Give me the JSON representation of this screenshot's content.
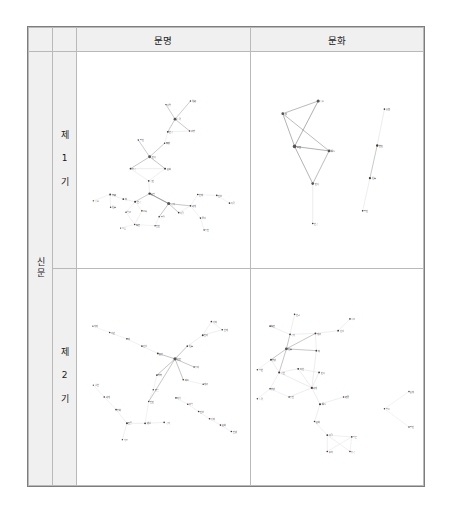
{
  "figure": {
    "caption": "",
    "colors": {
      "node": "#3a3a3a",
      "hub": "#555555",
      "edge": "#6e6e6e",
      "edge_light": "#c8c8c8",
      "header_bg": "#f0f0f0",
      "border": "#b9b9b9",
      "outer_border": "#7d7d7d",
      "label": "#1a1a1a"
    },
    "columns": [
      {
        "id": "munmyeong",
        "label": "문명"
      },
      {
        "id": "munhwa",
        "label": "문화"
      }
    ],
    "row_group_label": "신문",
    "rows": [
      {
        "id": "period1",
        "label": "제\n1\n기"
      },
      {
        "id": "period2",
        "label": "제\n2\n기"
      }
    ]
  },
  "chart_data": [
    {
      "id": "p1-munmyeong",
      "type": "network",
      "title": "제1기 · 문명",
      "nodes": [
        {
          "id": "n1",
          "label": "사업",
          "x": 196,
          "y": 58,
          "r": 1.6
        },
        {
          "id": "n2",
          "label": "洗練",
          "x": 250,
          "y": 50,
          "r": 1.6
        },
        {
          "id": "n3",
          "label": "노력",
          "x": 216,
          "y": 90,
          "r": 3.2
        },
        {
          "id": "n4",
          "label": "경향",
          "x": 248,
          "y": 116,
          "r": 1.8
        },
        {
          "id": "n5",
          "label": "한국",
          "x": 200,
          "y": 118,
          "r": 2.0
        },
        {
          "id": "n6",
          "label": "朝鮮",
          "x": 193,
          "y": 143,
          "r": 1.6
        },
        {
          "id": "n7",
          "label": "발전",
          "x": 135,
          "y": 136,
          "r": 1.6
        },
        {
          "id": "n8",
          "label": "민족",
          "x": 160,
          "y": 173,
          "r": 3.2
        },
        {
          "id": "n9",
          "label": "조국",
          "x": 118,
          "y": 199,
          "r": 2.0
        },
        {
          "id": "n10",
          "label": "문화",
          "x": 194,
          "y": 199,
          "r": 2.2
        },
        {
          "id": "n11",
          "label": "국민",
          "x": 158,
          "y": 226,
          "r": 1.8
        },
        {
          "id": "n12",
          "label": "문명",
          "x": 160,
          "y": 254,
          "r": 2.6
        },
        {
          "id": "n13",
          "label": "국가",
          "x": 202,
          "y": 276,
          "r": 3.4
        },
        {
          "id": "n14",
          "label": "한국",
          "x": 128,
          "y": 272,
          "r": 2.2
        },
        {
          "id": "n15",
          "label": "新",
          "x": 102,
          "y": 266,
          "r": 2.0
        },
        {
          "id": "n16",
          "label": "交驩",
          "x": 73,
          "y": 256,
          "r": 2.0
        },
        {
          "id": "n17",
          "label": "흡수",
          "x": 36,
          "y": 270,
          "r": 1.6
        },
        {
          "id": "n18",
          "label": "社會",
          "x": 74,
          "y": 284,
          "r": 1.6
        },
        {
          "id": "n19",
          "label": "학교",
          "x": 108,
          "y": 295,
          "r": 1.6
        },
        {
          "id": "n20",
          "label": "교육",
          "x": 143,
          "y": 292,
          "r": 1.8
        },
        {
          "id": "n21",
          "label": "人士",
          "x": 96,
          "y": 330,
          "r": 1.4
        },
        {
          "id": "n22",
          "label": "程度",
          "x": 127,
          "y": 322,
          "r": 1.6
        },
        {
          "id": "n23",
          "label": "인민",
          "x": 172,
          "y": 325,
          "r": 1.6
        },
        {
          "id": "n24",
          "label": "발달",
          "x": 181,
          "y": 305,
          "r": 1.8
        },
        {
          "id": "n25",
          "label": "사람",
          "x": 224,
          "y": 296,
          "r": 1.8
        },
        {
          "id": "n26",
          "label": "세계",
          "x": 250,
          "y": 281,
          "r": 1.8
        },
        {
          "id": "n27",
          "label": "현재",
          "x": 266,
          "y": 256,
          "r": 1.8
        },
        {
          "id": "n28",
          "label": "진보",
          "x": 308,
          "y": 258,
          "r": 1.8
        },
        {
          "id": "n29",
          "label": "독립",
          "x": 336,
          "y": 275,
          "r": 1.8
        },
        {
          "id": "n30",
          "label": "물질",
          "x": 272,
          "y": 308,
          "r": 1.8
        },
        {
          "id": "n31",
          "label": "증진",
          "x": 280,
          "y": 334,
          "r": 1.6
        }
      ],
      "edges": [
        [
          "n1",
          "n3"
        ],
        [
          "n2",
          "n3"
        ],
        [
          "n3",
          "n4"
        ],
        [
          "n3",
          "n5"
        ],
        [
          "n5",
          "n4"
        ],
        [
          "n5",
          "n6"
        ],
        [
          "n6",
          "n8"
        ],
        [
          "n7",
          "n8"
        ],
        [
          "n8",
          "n9"
        ],
        [
          "n8",
          "n10"
        ],
        [
          "n9",
          "n10"
        ],
        [
          "n9",
          "n11"
        ],
        [
          "n10",
          "n11"
        ],
        [
          "n11",
          "n12"
        ],
        [
          "n12",
          "n13"
        ],
        [
          "n12",
          "n14"
        ],
        [
          "n14",
          "n15"
        ],
        [
          "n15",
          "n16"
        ],
        [
          "n16",
          "n17"
        ],
        [
          "n16",
          "n18"
        ],
        [
          "n14",
          "n19"
        ],
        [
          "n14",
          "n20"
        ],
        [
          "n19",
          "n22"
        ],
        [
          "n20",
          "n22"
        ],
        [
          "n21",
          "n22"
        ],
        [
          "n22",
          "n23"
        ],
        [
          "n13",
          "n24"
        ],
        [
          "n24",
          "n23"
        ],
        [
          "n13",
          "n25"
        ],
        [
          "n13",
          "n26"
        ],
        [
          "n26",
          "n25"
        ],
        [
          "n26",
          "n27"
        ],
        [
          "n27",
          "n28"
        ],
        [
          "n28",
          "n29"
        ],
        [
          "n26",
          "n30"
        ],
        [
          "n30",
          "n31"
        ],
        [
          "n13",
          "n12"
        ]
      ]
    },
    {
      "id": "p1-munhwa",
      "type": "network",
      "title": "제1기 · 문화",
      "nodes": [
        {
          "id": "m1",
          "label": "흡수",
          "x": 148,
          "y": 50,
          "r": 3.4
        },
        {
          "id": "m2",
          "label": "新",
          "x": 70,
          "y": 78,
          "r": 3.0
        },
        {
          "id": "m3",
          "label": "泰西",
          "x": 96,
          "y": 150,
          "r": 4.0
        },
        {
          "id": "m4",
          "label": "輸入",
          "x": 172,
          "y": 160,
          "r": 3.2
        },
        {
          "id": "m5",
          "label": "민족",
          "x": 136,
          "y": 232,
          "r": 3.0
        },
        {
          "id": "m6",
          "label": "한국",
          "x": 136,
          "y": 320,
          "r": 1.8
        },
        {
          "id": "m7",
          "label": "東西",
          "x": 294,
          "y": 68,
          "r": 1.8
        },
        {
          "id": "m8",
          "label": "변천",
          "x": 278,
          "y": 148,
          "r": 2.6
        },
        {
          "id": "m9",
          "label": "社會",
          "x": 262,
          "y": 220,
          "r": 2.4
        },
        {
          "id": "m10",
          "label": "발전",
          "x": 246,
          "y": 292,
          "r": 1.8
        }
      ],
      "edges": [
        [
          "m1",
          "m2"
        ],
        [
          "m1",
          "m3"
        ],
        [
          "m2",
          "m4"
        ],
        [
          "m3",
          "m4"
        ],
        [
          "m2",
          "m3"
        ],
        [
          "m3",
          "m5"
        ],
        [
          "m4",
          "m5"
        ],
        [
          "m5",
          "m6"
        ],
        [
          "m7",
          "m8"
        ],
        [
          "m8",
          "m9"
        ],
        [
          "m9",
          "m10"
        ]
      ]
    },
    {
      "id": "p2-munmyeong",
      "type": "network",
      "title": "제2기 · 문명",
      "nodes": [
        {
          "id": "a1",
          "label": "의미",
          "x": 35,
          "y": 68,
          "r": 1.4
        },
        {
          "id": "a2",
          "label": "야만",
          "x": 72,
          "y": 82,
          "r": 1.6
        },
        {
          "id": "a3",
          "label": "新",
          "x": 110,
          "y": 96,
          "r": 1.8
        },
        {
          "id": "a4",
          "label": "건설",
          "x": 143,
          "y": 112,
          "r": 1.8
        },
        {
          "id": "a5",
          "label": "문명",
          "x": 178,
          "y": 128,
          "r": 2.0
        },
        {
          "id": "a6",
          "label": "眞正",
          "x": 216,
          "y": 140,
          "r": 3.6
        },
        {
          "id": "a7",
          "label": "社會",
          "x": 243,
          "y": 112,
          "r": 1.8
        },
        {
          "id": "a8",
          "label": "진리",
          "x": 277,
          "y": 88,
          "r": 2.0
        },
        {
          "id": "a9",
          "label": "가치",
          "x": 296,
          "y": 58,
          "r": 1.8
        },
        {
          "id": "a10",
          "label": "현재",
          "x": 320,
          "y": 76,
          "r": 1.8
        },
        {
          "id": "a11",
          "label": "증대",
          "x": 258,
          "y": 158,
          "r": 1.6
        },
        {
          "id": "a12",
          "label": "제도",
          "x": 234,
          "y": 186,
          "r": 1.8
        },
        {
          "id": "a13",
          "label": "계급",
          "x": 278,
          "y": 196,
          "r": 1.6
        },
        {
          "id": "a14",
          "label": "행복",
          "x": 176,
          "y": 176,
          "r": 1.8
        },
        {
          "id": "a15",
          "label": "향유",
          "x": 168,
          "y": 208,
          "r": 1.6
        },
        {
          "id": "a16",
          "label": "인민",
          "x": 158,
          "y": 234,
          "r": 1.6
        },
        {
          "id": "a17",
          "label": "실현",
          "x": 36,
          "y": 198,
          "r": 1.4
        },
        {
          "id": "a18",
          "label": "세계",
          "x": 60,
          "y": 224,
          "r": 1.8
        },
        {
          "id": "a19",
          "label": "평화",
          "x": 86,
          "y": 252,
          "r": 1.8
        },
        {
          "id": "a20",
          "label": "인류",
          "x": 110,
          "y": 282,
          "r": 2.2
        },
        {
          "id": "a21",
          "label": "생활",
          "x": 150,
          "y": 282,
          "r": 2.0
        },
        {
          "id": "a22",
          "label": "국가",
          "x": 192,
          "y": 280,
          "r": 1.8
        },
        {
          "id": "a23",
          "label": "기초",
          "x": 100,
          "y": 318,
          "r": 1.6
        },
        {
          "id": "a24",
          "label": "지식",
          "x": 218,
          "y": 226,
          "r": 1.8
        },
        {
          "id": "a25",
          "label": "과학",
          "x": 244,
          "y": 240,
          "r": 1.8
        },
        {
          "id": "a26",
          "label": "진보",
          "x": 268,
          "y": 256,
          "r": 1.8
        },
        {
          "id": "a27",
          "label": "정치",
          "x": 292,
          "y": 272,
          "r": 1.8
        },
        {
          "id": "a28",
          "label": "문화",
          "x": 316,
          "y": 286,
          "r": 1.8
        },
        {
          "id": "a29",
          "label": "인생",
          "x": 340,
          "y": 300,
          "r": 1.8
        }
      ],
      "edges": [
        [
          "a1",
          "a2"
        ],
        [
          "a2",
          "a3"
        ],
        [
          "a3",
          "a4"
        ],
        [
          "a4",
          "a5"
        ],
        [
          "a5",
          "a6"
        ],
        [
          "a6",
          "a7"
        ],
        [
          "a7",
          "a8"
        ],
        [
          "a8",
          "a9"
        ],
        [
          "a8",
          "a10"
        ],
        [
          "a9",
          "a10"
        ],
        [
          "a6",
          "a11"
        ],
        [
          "a6",
          "a12"
        ],
        [
          "a12",
          "a13"
        ],
        [
          "a6",
          "a14"
        ],
        [
          "a14",
          "a15"
        ],
        [
          "a15",
          "a16"
        ],
        [
          "a6",
          "a16"
        ],
        [
          "a17",
          "a18"
        ],
        [
          "a18",
          "a19"
        ],
        [
          "a19",
          "a20"
        ],
        [
          "a20",
          "a21"
        ],
        [
          "a21",
          "a22"
        ],
        [
          "a20",
          "a23"
        ],
        [
          "a21",
          "a16"
        ],
        [
          "a24",
          "a25"
        ],
        [
          "a25",
          "a26"
        ],
        [
          "a26",
          "a27"
        ],
        [
          "a27",
          "a28"
        ],
        [
          "a28",
          "a29"
        ]
      ]
    },
    {
      "id": "p2-munhwa",
      "type": "network",
      "title": "제2기 · 문화",
      "nodes": [
        {
          "id": "b1",
          "label": "연구",
          "x": 96,
          "y": 42,
          "r": 1.8
        },
        {
          "id": "b2",
          "label": "程度",
          "x": 42,
          "y": 68,
          "r": 1.8
        },
        {
          "id": "b3",
          "label": "국가",
          "x": 86,
          "y": 86,
          "r": 2.0
        },
        {
          "id": "b4",
          "label": "계급",
          "x": 142,
          "y": 84,
          "r": 2.0
        },
        {
          "id": "b5",
          "label": "시설",
          "x": 218,
          "y": 52,
          "r": 1.8
        },
        {
          "id": "b6",
          "label": "건설",
          "x": 192,
          "y": 78,
          "r": 2.0
        },
        {
          "id": "b7",
          "label": "社會",
          "x": 78,
          "y": 118,
          "r": 3.2
        },
        {
          "id": "b8",
          "label": "新",
          "x": 144,
          "y": 122,
          "r": 2.0
        },
        {
          "id": "b9",
          "label": "향상",
          "x": 44,
          "y": 142,
          "r": 2.0
        },
        {
          "id": "b10",
          "label": "일반",
          "x": 14,
          "y": 164,
          "r": 1.6
        },
        {
          "id": "b11",
          "label": "공헌",
          "x": 62,
          "y": 170,
          "r": 2.2
        },
        {
          "id": "b12",
          "label": "자연",
          "x": 104,
          "y": 162,
          "r": 2.0
        },
        {
          "id": "b13",
          "label": "민족",
          "x": 150,
          "y": 170,
          "r": 2.0
        },
        {
          "id": "b14",
          "label": "세계",
          "x": 134,
          "y": 204,
          "r": 2.4
        },
        {
          "id": "b15",
          "label": "향상",
          "x": 42,
          "y": 206,
          "r": 1.8
        },
        {
          "id": "b16",
          "label": "노력",
          "x": 14,
          "y": 228,
          "r": 1.6
        },
        {
          "id": "b17",
          "label": "증진",
          "x": 84,
          "y": 224,
          "r": 1.8
        },
        {
          "id": "b18",
          "label": "輸入",
          "x": 152,
          "y": 240,
          "r": 2.4
        },
        {
          "id": "b19",
          "label": "發展",
          "x": 204,
          "y": 224,
          "r": 1.8
        },
        {
          "id": "b20",
          "label": "문화",
          "x": 140,
          "y": 278,
          "r": 1.8
        },
        {
          "id": "b21",
          "label": "사람",
          "x": 168,
          "y": 308,
          "r": 2.0
        },
        {
          "id": "b22",
          "label": "일본",
          "x": 222,
          "y": 312,
          "r": 1.8
        },
        {
          "id": "b23",
          "label": "풍속",
          "x": 168,
          "y": 344,
          "r": 1.8
        },
        {
          "id": "b24",
          "label": "중국",
          "x": 218,
          "y": 344,
          "r": 1.8
        },
        {
          "id": "b25",
          "label": "필요",
          "x": 294,
          "y": 250,
          "r": 1.6
        },
        {
          "id": "b26",
          "label": "존재",
          "x": 348,
          "y": 212,
          "r": 1.6
        },
        {
          "id": "b27",
          "label": "발전",
          "x": 348,
          "y": 290,
          "r": 1.6
        }
      ],
      "edges": [
        [
          "b1",
          "b3"
        ],
        [
          "b2",
          "b3"
        ],
        [
          "b3",
          "b4"
        ],
        [
          "b3",
          "b7"
        ],
        [
          "b4",
          "b7"
        ],
        [
          "b5",
          "b6"
        ],
        [
          "b6",
          "b4"
        ],
        [
          "b4",
          "b8"
        ],
        [
          "b7",
          "b8"
        ],
        [
          "b8",
          "b14"
        ],
        [
          "b7",
          "b9"
        ],
        [
          "b9",
          "b10"
        ],
        [
          "b9",
          "b11"
        ],
        [
          "b7",
          "b11"
        ],
        [
          "b11",
          "b12"
        ],
        [
          "b12",
          "b13"
        ],
        [
          "b13",
          "b14"
        ],
        [
          "b12",
          "b14"
        ],
        [
          "b11",
          "b14"
        ],
        [
          "b11",
          "b15"
        ],
        [
          "b15",
          "b16"
        ],
        [
          "b15",
          "b17"
        ],
        [
          "b17",
          "b14"
        ],
        [
          "b14",
          "b18"
        ],
        [
          "b18",
          "b19"
        ],
        [
          "b18",
          "b20"
        ],
        [
          "b20",
          "b21"
        ],
        [
          "b21",
          "b22"
        ],
        [
          "b21",
          "b23"
        ],
        [
          "b21",
          "b24"
        ],
        [
          "b23",
          "b22"
        ],
        [
          "b24",
          "b22"
        ],
        [
          "b25",
          "b26"
        ],
        [
          "b25",
          "b27"
        ]
      ]
    }
  ]
}
